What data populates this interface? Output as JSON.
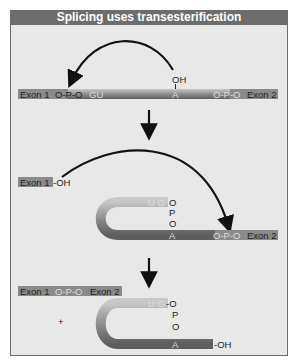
{
  "title": "Splicing uses transesterification",
  "colors": {
    "title_bg": "#6d6d6d",
    "panel_bg": "#e8e8e8",
    "exon_bg": "#8a8a8a",
    "intron_tube": "#9a9a9a",
    "arrow": "#111111"
  },
  "step1": {
    "exon1": "Exon 1",
    "link_left": "O-P-O",
    "gu": "GU",
    "a": "A",
    "oh": "OH",
    "link_right": "O-P-O",
    "exon2": "Exon 2"
  },
  "step2": {
    "exon1": "Exon 1",
    "exon1_oh": "-OH",
    "ug": "U G",
    "branch_o1": "O",
    "branch_p": "P",
    "branch_o2": "O",
    "a": "A",
    "link_right": "O-P-O",
    "exon2": "Exon 2"
  },
  "step3": {
    "exon1": "Exon 1",
    "link": "O-P-O",
    "exon2": "Exon 2",
    "plus": "+",
    "ug": "U G",
    "branch_o1": "-O",
    "branch_p": "P",
    "branch_o2": "O",
    "a": "A",
    "oh": "-OH"
  }
}
